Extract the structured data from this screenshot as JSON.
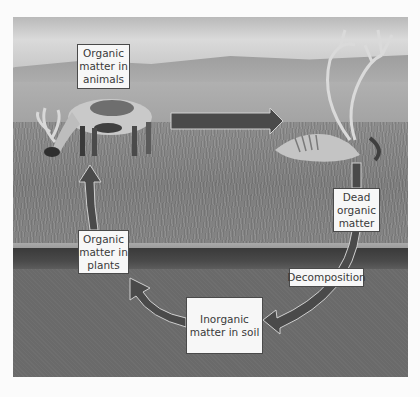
{
  "diagram": {
    "type": "nutrient-cycle",
    "nodes": [
      {
        "id": "animals",
        "lines": [
          "Organic",
          "matter in",
          "animals"
        ]
      },
      {
        "id": "dead",
        "lines": [
          "Dead",
          "organic",
          "matter"
        ]
      },
      {
        "id": "soil",
        "lines": [
          "Inorganic",
          "matter in soil"
        ]
      },
      {
        "id": "plants",
        "lines": [
          "Organic",
          "matter in",
          "plants"
        ]
      }
    ],
    "edges": [
      {
        "from": "animals",
        "to": "dead",
        "label": ""
      },
      {
        "from": "dead",
        "to": "soil",
        "label": "Decomposition"
      },
      {
        "from": "soil",
        "to": "plants",
        "label": ""
      },
      {
        "from": "plants",
        "to": "animals",
        "label": ""
      }
    ],
    "process_label": "Decomposition",
    "arrow_color": "#4a4a4a"
  }
}
